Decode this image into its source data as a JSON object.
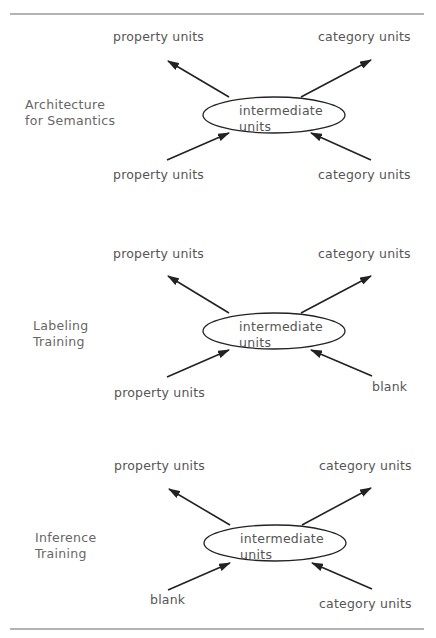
{
  "figure": {
    "panels": [
      {
        "title_line1": "Architecture",
        "title_line2": "for Semantics",
        "top_left": "property units",
        "top_right": "category units",
        "center_line1": "intermediate",
        "center_line2": "units",
        "bottom_left": "property units",
        "bottom_right": "category units"
      },
      {
        "title_line1": "Labeling",
        "title_line2": "Training",
        "top_left": "property units",
        "top_right": "category units",
        "center_line1": "intermediate",
        "center_line2": "units",
        "bottom_left": "property  units",
        "bottom_right": "blank"
      },
      {
        "title_line1": "Inference",
        "title_line2": "Training",
        "top_left": "property units",
        "top_right": "category units",
        "center_line1": "intermediate",
        "center_line2": "units",
        "bottom_left": "blank",
        "bottom_right": "category units"
      }
    ],
    "colors": {
      "line": "#222222",
      "text": "#555555"
    }
  }
}
